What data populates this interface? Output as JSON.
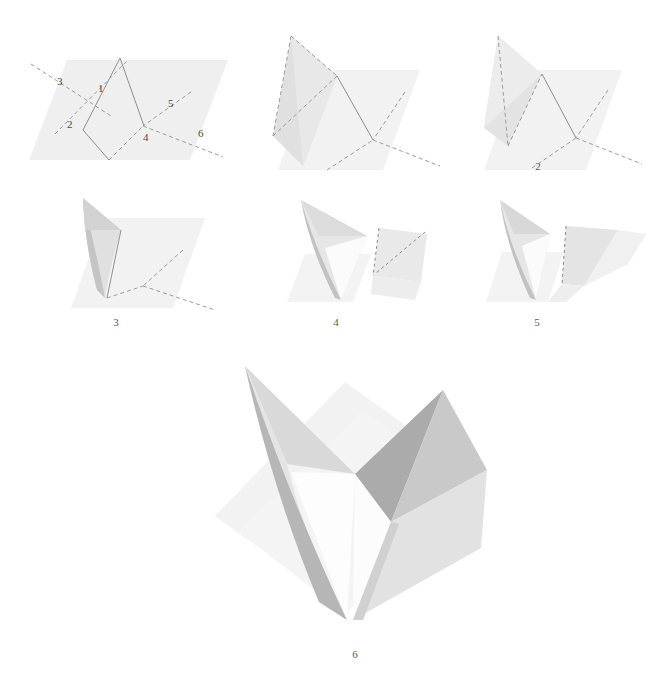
{
  "figure": {
    "kind": "folding-diagram",
    "background_color": "#ffffff",
    "paper_color": "#f0f0f0",
    "paper_shade_light": "#e2e2e2",
    "paper_shade_mid": "#c9c9c9",
    "paper_shade_dark": "#a9a9a9",
    "crease_solid_color": "#8a8a8a",
    "crease_dashed_color": "#9a9a9a",
    "label_color": "#4a4a4a"
  },
  "crease_pattern": {
    "caption": "",
    "numbers": [
      {
        "id": "crease-1",
        "label": "1",
        "x": 88,
        "y": 72,
        "type": "valley-solid"
      },
      {
        "id": "crease-2",
        "label": "2",
        "x": 57,
        "y": 108,
        "type": "mountain-dashed"
      },
      {
        "id": "crease-3",
        "label": "3",
        "x": 47,
        "y": 65,
        "type": "mountain-dashed"
      },
      {
        "id": "crease-4",
        "label": "4",
        "x": 133,
        "y": 121,
        "type": "mountain-dashed"
      },
      {
        "id": "crease-5",
        "label": "5",
        "x": 158,
        "y": 87,
        "type": "mountain-dashed"
      },
      {
        "id": "crease-6",
        "label": "6",
        "x": 188,
        "y": 117,
        "type": "mountain-dashed"
      }
    ]
  },
  "steps": [
    {
      "id": "step-2",
      "label": "2",
      "x": 518,
      "y": 160
    },
    {
      "id": "step-3",
      "label": "3",
      "x": 96,
      "y": 316
    },
    {
      "id": "step-4",
      "label": "4",
      "x": 316,
      "y": 316
    },
    {
      "id": "step-5",
      "label": "5",
      "x": 517,
      "y": 316
    },
    {
      "id": "step-6",
      "label": "6",
      "x": 335,
      "y": 648
    }
  ]
}
